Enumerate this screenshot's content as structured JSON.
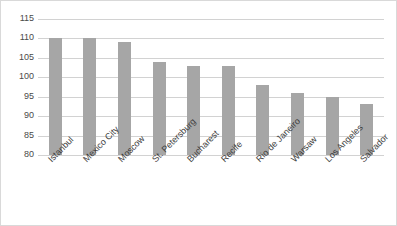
{
  "chart_data": {
    "type": "bar",
    "title": "",
    "xlabel": "",
    "ylabel": "",
    "ylim": [
      80,
      115
    ],
    "ytick_step": 5,
    "yticks": [
      115,
      110,
      105,
      100,
      95,
      90,
      85,
      80
    ],
    "grid": true,
    "legend": "none",
    "bar_color": "#a6a6a6",
    "gridline_color": "#d2d2d2",
    "categories": [
      "Istanbul",
      "Mexico City",
      "Moscow",
      "St. Petersburg",
      "Bucharest",
      "Recife",
      "Rio de Janeiro",
      "Warsaw",
      "Los Angeles",
      "Salvador"
    ],
    "values": [
      110,
      110,
      109,
      104,
      103,
      103,
      98,
      96,
      95,
      93
    ]
  }
}
